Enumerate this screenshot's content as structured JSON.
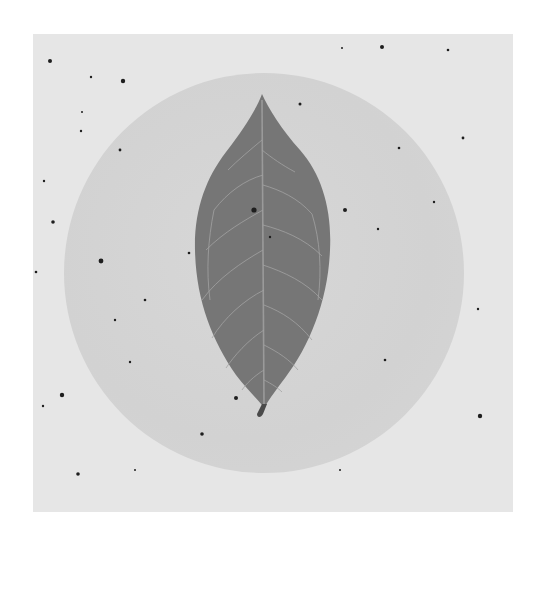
{
  "image": {
    "description": "Grayscale photograph of a single leaf placed over a light gray circular disc on a speckled pale paper background",
    "subject": "leaf",
    "colors": {
      "page_background": "#ffffff",
      "paper": "#e6e6e6",
      "circle": "#d4d4d4",
      "leaf": "#777777",
      "leaf_veins": "#a6a6a6",
      "speckles": "#1e1e1e"
    }
  }
}
